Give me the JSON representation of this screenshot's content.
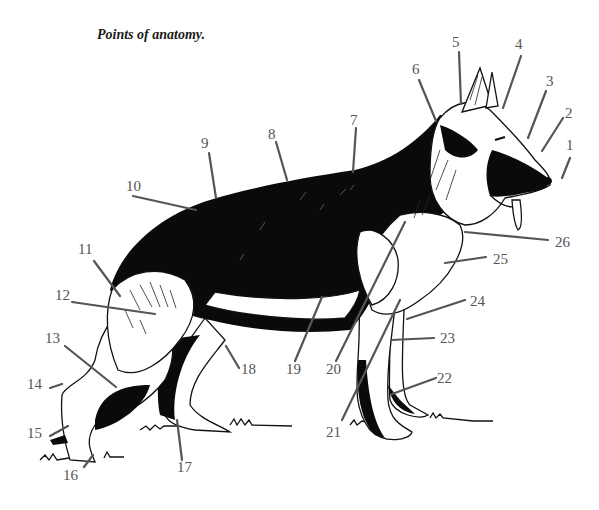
{
  "title": "Points of anatomy.",
  "figure": {
    "colors": {
      "ink": "#0a0a0a",
      "label": "#555555",
      "background": "#ffffff"
    }
  },
  "labels": [
    {
      "n": "1",
      "x": 566,
      "y": 150,
      "lx1": 570,
      "ly1": 158,
      "lx2": 562,
      "ly2": 178
    },
    {
      "n": "2",
      "x": 565,
      "y": 118,
      "lx1": 563,
      "ly1": 118,
      "lx2": 542,
      "ly2": 151
    },
    {
      "n": "3",
      "x": 546,
      "y": 86,
      "lx1": 546,
      "ly1": 91,
      "lx2": 528,
      "ly2": 138
    },
    {
      "n": "4",
      "x": 515,
      "y": 49,
      "lx1": 521,
      "ly1": 56,
      "lx2": 503,
      "ly2": 108
    },
    {
      "n": "5",
      "x": 452,
      "y": 47,
      "lx1": 459,
      "ly1": 52,
      "lx2": 461,
      "ly2": 104
    },
    {
      "n": "6",
      "x": 412,
      "y": 74,
      "lx1": 419,
      "ly1": 80,
      "lx2": 436,
      "ly2": 121
    },
    {
      "n": "7",
      "x": 350,
      "y": 125,
      "lx1": 356,
      "ly1": 128,
      "lx2": 353,
      "ly2": 172
    },
    {
      "n": "8",
      "x": 268,
      "y": 139,
      "lx1": 276,
      "ly1": 142,
      "lx2": 287,
      "ly2": 180
    },
    {
      "n": "9",
      "x": 201,
      "y": 148,
      "lx1": 209,
      "ly1": 153,
      "lx2": 216,
      "ly2": 198
    },
    {
      "n": "10",
      "x": 126,
      "y": 191,
      "lx1": 133,
      "ly1": 196,
      "lx2": 196,
      "ly2": 210
    },
    {
      "n": "11",
      "x": 78,
      "y": 254,
      "lx1": 94,
      "ly1": 261,
      "lx2": 120,
      "ly2": 296
    },
    {
      "n": "12",
      "x": 55,
      "y": 300,
      "lx1": 72,
      "ly1": 302,
      "lx2": 155,
      "ly2": 314
    },
    {
      "n": "13",
      "x": 45,
      "y": 343,
      "lx1": 65,
      "ly1": 346,
      "lx2": 116,
      "ly2": 387
    },
    {
      "n": "14",
      "x": 27,
      "y": 389,
      "lx1": 50,
      "ly1": 388,
      "lx2": 62,
      "ly2": 384
    },
    {
      "n": "15",
      "x": 27,
      "y": 438,
      "lx1": 50,
      "ly1": 436,
      "lx2": 68,
      "ly2": 426
    },
    {
      "n": "16",
      "x": 63,
      "y": 480,
      "lx1": 84,
      "ly1": 467,
      "lx2": 93,
      "ly2": 455
    },
    {
      "n": "17",
      "x": 177,
      "y": 472,
      "lx1": 182,
      "ly1": 460,
      "lx2": 177,
      "ly2": 420
    },
    {
      "n": "18",
      "x": 241,
      "y": 374,
      "lx1": 239,
      "ly1": 368,
      "lx2": 226,
      "ly2": 346
    },
    {
      "n": "19",
      "x": 286,
      "y": 374,
      "lx1": 295,
      "ly1": 361,
      "lx2": 322,
      "ly2": 297
    },
    {
      "n": "20",
      "x": 326,
      "y": 374,
      "lx1": 336,
      "ly1": 361,
      "lx2": 405,
      "ly2": 222
    },
    {
      "n": "21",
      "x": 326,
      "y": 437,
      "lx1": 342,
      "ly1": 420,
      "lx2": 400,
      "ly2": 300
    },
    {
      "n": "22",
      "x": 437,
      "y": 383,
      "lx1": 436,
      "ly1": 378,
      "lx2": 392,
      "ly2": 394
    },
    {
      "n": "23",
      "x": 440,
      "y": 343,
      "lx1": 434,
      "ly1": 338,
      "lx2": 391,
      "ly2": 340
    },
    {
      "n": "24",
      "x": 470,
      "y": 306,
      "lx1": 465,
      "ly1": 300,
      "lx2": 407,
      "ly2": 319
    },
    {
      "n": "25",
      "x": 493,
      "y": 264,
      "lx1": 486,
      "ly1": 257,
      "lx2": 445,
      "ly2": 263
    },
    {
      "n": "26",
      "x": 555,
      "y": 247,
      "lx1": 548,
      "ly1": 240,
      "lx2": 465,
      "ly2": 232
    }
  ]
}
